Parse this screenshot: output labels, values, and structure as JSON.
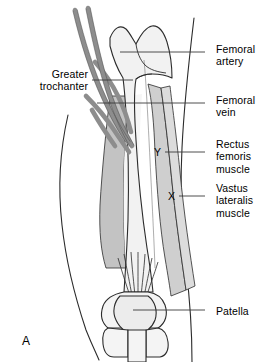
{
  "figure": {
    "panel_letter": "A",
    "background_color": "#ffffff"
  },
  "colors": {
    "outline": "#2b2b2b",
    "bone_fill": "#f2f2f2",
    "vessel_fill": "#8d8d8d",
    "muscle_dark": "#c3c3c3",
    "muscle_mid": "#cfcfcf",
    "muscle_light": "#dcdcdc",
    "muscle_pale": "#ececec",
    "leader_line": "#3a3a3a",
    "text": "#000000"
  },
  "labels": {
    "right": [
      {
        "id": "femoral-artery",
        "text": "Femoral\nartery",
        "x": 216,
        "y": 43,
        "leader_y": 52,
        "leader_x1": 205,
        "leader_x2": 120
      },
      {
        "id": "femoral-vein",
        "text": "Femoral\nvein",
        "x": 216,
        "y": 94,
        "leader_y": 103,
        "leader_x1": 205,
        "leader_x2": 97
      },
      {
        "id": "rectus-femoris-muscle",
        "text": "Rectus\nfemoris\nmuscle",
        "x": 216,
        "y": 138,
        "leader_y": 152,
        "leader_x1": 205,
        "leader_x2": 165
      },
      {
        "id": "vastus-lateralis-muscle",
        "text": "Vastus\nlateralis\nmuscle",
        "x": 216,
        "y": 182,
        "leader_y": 196,
        "leader_x1": 205,
        "leader_x2": 179
      },
      {
        "id": "patella",
        "text": "Patella",
        "x": 216,
        "y": 305,
        "leader_y": 310,
        "leader_x1": 205,
        "leader_x2": 133
      }
    ],
    "left": [
      {
        "id": "greater-trochanter",
        "text": "Greater\ntrochanter",
        "x": 10,
        "y": 68,
        "width": 78,
        "leader_y": 80,
        "leader_x1": 92,
        "leader_x2": 133
      }
    ],
    "markers": [
      {
        "id": "marker-y",
        "text": "Y",
        "x": 154,
        "y": 146
      },
      {
        "id": "marker-x",
        "text": "X",
        "x": 168,
        "y": 190
      }
    ]
  }
}
